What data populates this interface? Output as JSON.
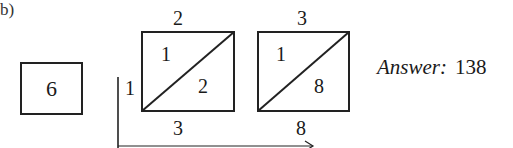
{
  "part_label": "b)",
  "multiplier_box": {
    "value": "6"
  },
  "lattice": {
    "columns": [
      {
        "top_digit": "2",
        "upper_left": "1",
        "lower_right": "2",
        "bottom_digit": "3"
      },
      {
        "top_digit": "3",
        "upper_left": "1",
        "lower_right": "8",
        "bottom_digit": "8"
      }
    ],
    "left_digit": "1"
  },
  "answer": {
    "label": "Answer:",
    "value": "138"
  },
  "colors": {
    "ink": "#1a1a1a",
    "background": "#ffffff"
  }
}
